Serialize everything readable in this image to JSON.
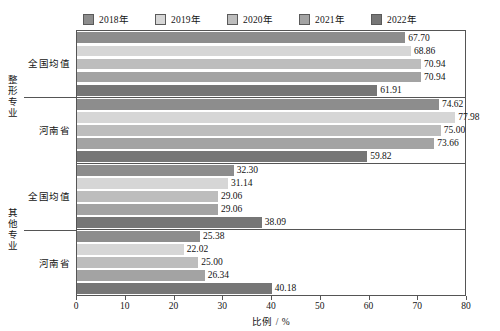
{
  "chart_data": {
    "type": "bar",
    "orientation": "horizontal",
    "title": "",
    "xlabel": "比例 / %",
    "ylabel": "",
    "xlim": [
      0,
      80
    ],
    "xticks": [
      0,
      10,
      20,
      30,
      40,
      50,
      60,
      70,
      80
    ],
    "grid": false,
    "legend_position": "top",
    "outer_categories": [
      "整形专业",
      "其他专业"
    ],
    "inner_categories": [
      "全国均值",
      "河南省"
    ],
    "categories": [
      "整形专业 - 全国均值",
      "整形专业 - 河南省",
      "其他专业 - 全国均值",
      "其他专业 - 河南省"
    ],
    "series": [
      {
        "name": "2018年",
        "color": "#8d8d8d",
        "values": [
          67.7,
          74.62,
          32.3,
          25.38
        ]
      },
      {
        "name": "2019年",
        "color": "#d6d6d6",
        "values": [
          68.86,
          77.98,
          31.14,
          22.02
        ]
      },
      {
        "name": "2020年",
        "color": "#bdbdbd",
        "values": [
          70.94,
          75.0,
          29.06,
          25.0
        ]
      },
      {
        "name": "2021年",
        "color": "#a3a3a3",
        "values": [
          70.94,
          73.66,
          29.06,
          26.34
        ]
      },
      {
        "name": "2022年",
        "color": "#767676",
        "values": [
          61.91,
          59.82,
          38.09,
          40.18
        ]
      }
    ],
    "value_labels": [
      [
        "67.70",
        "68.86",
        "70.94",
        "70.94",
        "61.91"
      ],
      [
        "74.62",
        "77.98",
        "75.00",
        "73.66",
        "59.82"
      ],
      [
        "32.30",
        "31.14",
        "29.06",
        "29.06",
        "38.09"
      ],
      [
        "25.38",
        "22.02",
        "25.00",
        "26.34",
        "40.18"
      ]
    ]
  },
  "legend": {
    "items": [
      {
        "label": "2018年",
        "color": "#8d8d8d"
      },
      {
        "label": "2019年",
        "color": "#d6d6d6"
      },
      {
        "label": "2020年",
        "color": "#bdbdbd"
      },
      {
        "label": "2021年",
        "color": "#a3a3a3"
      },
      {
        "label": "2022年",
        "color": "#767676"
      }
    ]
  },
  "axes": {
    "x_title": "比例 / %",
    "x_tick_labels": [
      "0",
      "10",
      "20",
      "30",
      "40",
      "50",
      "60",
      "70",
      "80"
    ],
    "y_outer_labels": [
      "整形专业",
      "其他专业"
    ],
    "y_inner_labels": [
      "全国均值",
      "河南省",
      "全国均值",
      "河南省"
    ]
  }
}
